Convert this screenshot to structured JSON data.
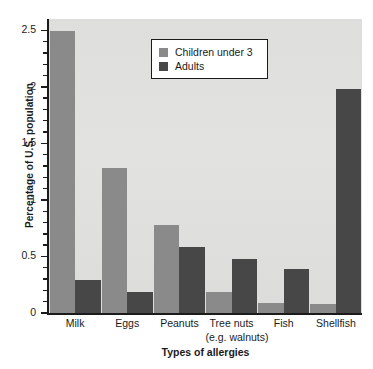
{
  "chart_data": {
    "type": "bar",
    "title": "",
    "xlabel": "Types of allergies",
    "ylabel": "Percentage of U.S. population",
    "categories": [
      "Milk",
      "Eggs",
      "Peanuts",
      "Tree nuts",
      "Fish",
      "Shellfish"
    ],
    "category_sublabels": [
      "",
      "",
      "",
      "(e.g. walnuts)",
      "",
      ""
    ],
    "series": [
      {
        "name": "Children under 3",
        "color": "#8a8a8a",
        "values": [
          2.49,
          1.28,
          0.78,
          0.19,
          0.09,
          0.08
        ]
      },
      {
        "name": "Adults",
        "color": "#474747",
        "values": [
          0.29,
          0.19,
          0.58,
          0.48,
          0.39,
          1.98
        ]
      }
    ],
    "ylim": [
      0,
      2.6
    ],
    "ytick_values": [
      0,
      0.5,
      1,
      1.5,
      2,
      2.5
    ],
    "ytick_labels": [
      "0",
      "0.5",
      "1",
      "1.5",
      "2",
      "2.5"
    ],
    "yminor_step": 0.1,
    "grid": false,
    "legend_position": "upper center",
    "plot_background": "#e0e0de"
  },
  "legend": {
    "entries": [
      {
        "label": "Children under 3"
      },
      {
        "label": "Adults"
      }
    ]
  }
}
